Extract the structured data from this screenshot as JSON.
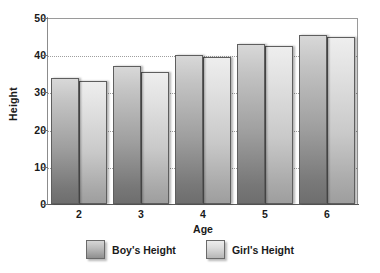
{
  "chart_data": {
    "type": "bar",
    "title": "",
    "subtitle": "",
    "xlabel": "Age",
    "ylabel": "Height",
    "categories": [
      "2",
      "3",
      "4",
      "5",
      "6"
    ],
    "series": [
      {
        "name": "Boy's Height",
        "values": [
          34,
          37,
          40,
          43,
          45.5
        ],
        "color": "#9f9f9f"
      },
      {
        "name": "Girl's Height",
        "values": [
          33,
          35.5,
          39.5,
          42.5,
          45
        ],
        "color": "#c9c9c9"
      }
    ],
    "ylim": [
      0,
      50
    ],
    "yticks": [
      0,
      10,
      20,
      30,
      40,
      50
    ],
    "ytick_labels": [
      "0",
      "10",
      "20",
      "30",
      "40",
      "50"
    ],
    "grid": true,
    "grid_axis": "y",
    "grid_style": "dotted",
    "legend_position": "bottom",
    "legend": [
      "Boy's Height",
      "Girl's Height"
    ],
    "annotations": []
  },
  "axes": {
    "y_title": "Height",
    "x_title": "Age"
  },
  "legend_items": [
    {
      "label": "Boy's Height",
      "swatch": "boy"
    },
    {
      "label": "Girl's Height",
      "swatch": "girl"
    }
  ]
}
